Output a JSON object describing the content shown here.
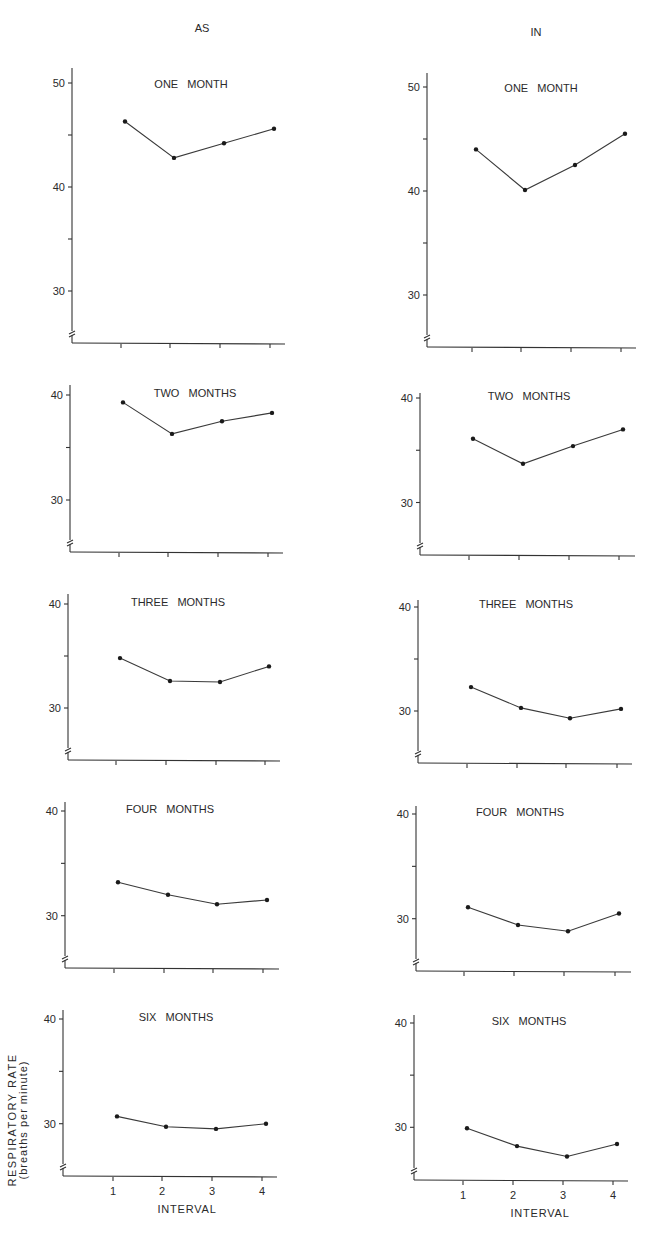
{
  "chart_data": {
    "type": "line",
    "title": "",
    "ylabel": "RESPIRATORY RATE (breaths per minute)",
    "ylabel_line1": "RESPIRATORY RATE",
    "ylabel_line2": "(breaths per minute)",
    "xlabel": "INTERVAL",
    "columns": [
      "AS",
      "IN"
    ],
    "x": [
      1,
      2,
      3,
      4
    ],
    "x_tick_labels": [
      "1",
      "2",
      "3",
      "4"
    ],
    "grid": false,
    "panels": [
      {
        "column": "AS",
        "title": "ONE MONTH",
        "ylim": [
          25,
          51
        ],
        "y_ticks": [
          30,
          35,
          40,
          45,
          50
        ],
        "y_tick_labels": [
          "30",
          "",
          "40",
          "",
          "50"
        ],
        "values": [
          46.3,
          42.8,
          44.2,
          45.6
        ]
      },
      {
        "column": "IN",
        "title": "ONE MONTH",
        "ylim": [
          25,
          51
        ],
        "y_ticks": [
          30,
          35,
          40,
          45,
          50
        ],
        "y_tick_labels": [
          "30",
          "",
          "40",
          "",
          "50"
        ],
        "values": [
          44.0,
          40.1,
          42.5,
          45.5
        ]
      },
      {
        "column": "AS",
        "title": "TWO MONTHS",
        "ylim": [
          25,
          41
        ],
        "y_ticks": [
          30,
          35,
          40
        ],
        "y_tick_labels": [
          "30",
          "",
          "40"
        ],
        "values": [
          39.3,
          36.3,
          37.5,
          38.3
        ]
      },
      {
        "column": "IN",
        "title": "TWO MONTHS",
        "ylim": [
          25,
          41
        ],
        "y_ticks": [
          30,
          35,
          40
        ],
        "y_tick_labels": [
          "30",
          "",
          "40"
        ],
        "values": [
          36.1,
          33.7,
          35.4,
          37.0
        ]
      },
      {
        "column": "AS",
        "title": "THREE MONTHS",
        "ylim": [
          25,
          41
        ],
        "y_ticks": [
          30,
          35,
          40
        ],
        "y_tick_labels": [
          "30",
          "",
          "40"
        ],
        "values": [
          34.8,
          32.6,
          32.5,
          34.0
        ]
      },
      {
        "column": "IN",
        "title": "THREE MONTHS",
        "ylim": [
          25,
          41
        ],
        "y_ticks": [
          30,
          35,
          40
        ],
        "y_tick_labels": [
          "30",
          "",
          "40"
        ],
        "values": [
          32.3,
          30.3,
          29.3,
          30.2
        ]
      },
      {
        "column": "AS",
        "title": "FOUR MONTHS",
        "ylim": [
          25,
          41
        ],
        "y_ticks": [
          30,
          35,
          40
        ],
        "y_tick_labels": [
          "30",
          "",
          "40"
        ],
        "values": [
          33.2,
          32.0,
          31.1,
          31.5
        ]
      },
      {
        "column": "IN",
        "title": "FOUR MONTHS",
        "ylim": [
          25,
          41
        ],
        "y_ticks": [
          30,
          35,
          40
        ],
        "y_tick_labels": [
          "30",
          "",
          "40"
        ],
        "values": [
          31.1,
          29.4,
          28.8,
          30.5
        ]
      },
      {
        "column": "AS",
        "title": "SIX MONTHS",
        "ylim": [
          25,
          41
        ],
        "y_ticks": [
          30,
          35,
          40
        ],
        "y_tick_labels": [
          "30",
          "",
          "40"
        ],
        "values": [
          30.7,
          29.7,
          29.5,
          30.0
        ]
      },
      {
        "column": "IN",
        "title": "SIX MONTHS",
        "ylim": [
          25,
          41
        ],
        "y_ticks": [
          30,
          35,
          40
        ],
        "y_tick_labels": [
          "30",
          "",
          "40"
        ],
        "values": [
          29.9,
          28.2,
          27.2,
          28.4
        ]
      }
    ]
  },
  "layout": {
    "panels": [
      {
        "axis_x": 72,
        "axis_top": 68,
        "baseline": 343,
        "x_end": 285,
        "y_ref_val": 40,
        "y_ref_px": 187,
        "px_per_unit": 10.4,
        "xticks": [
          121,
          170,
          220,
          270
        ],
        "title_x": 191,
        "title_y": 88,
        "show_x_labels": false
      },
      {
        "axis_x": 427,
        "axis_top": 73,
        "baseline": 347,
        "x_end": 636,
        "y_ref_val": 40,
        "y_ref_px": 191,
        "px_per_unit": 10.4,
        "xticks": [
          472,
          521,
          571,
          621
        ],
        "title_x": 541,
        "title_y": 92,
        "show_x_labels": false
      },
      {
        "axis_x": 70,
        "axis_top": 385,
        "baseline": 552,
        "x_end": 283,
        "y_ref_val": 40,
        "y_ref_px": 395,
        "px_per_unit": 10.5,
        "xticks": [
          119,
          168,
          218,
          268
        ],
        "title_x": 195,
        "title_y": 397,
        "show_x_labels": false
      },
      {
        "axis_x": 420,
        "axis_top": 393,
        "baseline": 555,
        "x_end": 635,
        "y_ref_val": 40,
        "y_ref_px": 398,
        "px_per_unit": 10.45,
        "xticks": [
          469,
          519,
          569,
          619
        ],
        "title_x": 529,
        "title_y": 400,
        "show_x_labels": false
      },
      {
        "axis_x": 68,
        "axis_top": 594,
        "baseline": 760,
        "x_end": 280,
        "y_ref_val": 40,
        "y_ref_px": 604,
        "px_per_unit": 10.4,
        "xticks": [
          116,
          166,
          216,
          265
        ],
        "title_x": 178,
        "title_y": 606,
        "show_x_labels": false
      },
      {
        "axis_x": 418,
        "axis_top": 600,
        "baseline": 763,
        "x_end": 632,
        "y_ref_val": 40,
        "y_ref_px": 607,
        "px_per_unit": 10.4,
        "xticks": [
          467,
          517,
          566,
          617
        ],
        "title_x": 526,
        "title_y": 608,
        "show_x_labels": false
      },
      {
        "axis_x": 65,
        "axis_top": 802,
        "baseline": 968,
        "x_end": 279,
        "y_ref_val": 40,
        "y_ref_px": 811,
        "px_per_unit": 10.47,
        "xticks": [
          114,
          164,
          213,
          263
        ],
        "title_x": 170,
        "title_y": 813,
        "show_x_labels": false
      },
      {
        "axis_x": 416,
        "axis_top": 806,
        "baseline": 971,
        "x_end": 631,
        "y_ref_val": 40,
        "y_ref_px": 814,
        "px_per_unit": 10.47,
        "xticks": [
          464,
          514,
          564,
          615
        ],
        "title_x": 520,
        "title_y": 816,
        "show_x_labels": false
      },
      {
        "axis_x": 63,
        "axis_top": 1010,
        "baseline": 1176,
        "x_end": 277,
        "y_ref_val": 40,
        "y_ref_px": 1019,
        "px_per_unit": 10.47,
        "xticks": [
          113,
          162,
          212,
          262
        ],
        "title_x": 176,
        "title_y": 1021,
        "show_x_labels": true,
        "xlabel_x": 187,
        "xlabel_y": 1213
      },
      {
        "axis_x": 414,
        "axis_top": 1015,
        "baseline": 1180,
        "x_end": 628,
        "y_ref_val": 40,
        "y_ref_px": 1023,
        "px_per_unit": 10.43,
        "xticks": [
          463,
          513,
          563,
          613
        ],
        "title_x": 529,
        "title_y": 1025,
        "show_x_labels": true,
        "xlabel_x": 540,
        "xlabel_y": 1217
      }
    ],
    "column_heads": [
      {
        "x": 202,
        "y": 32
      },
      {
        "x": 536,
        "y": 36
      }
    ],
    "ylabel_pos": {
      "x": 16,
      "y": 1120
    }
  }
}
